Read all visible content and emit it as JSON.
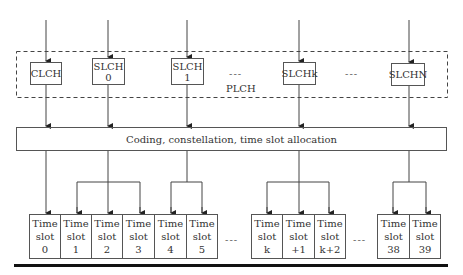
{
  "diagram": {
    "group_label": "PLCH",
    "channels": [
      {
        "line1": "CLCH",
        "line2": ""
      },
      {
        "line1": "SLCH",
        "line2": "0"
      },
      {
        "line1": "SLCH",
        "line2": "1"
      },
      {
        "line1": "SLCHk",
        "line2": ""
      },
      {
        "line1": "SLCHN",
        "line2": ""
      }
    ],
    "channel_ellipsis": "---",
    "process_block": "Coding, constellation, time slot allocation",
    "time_slots": [
      {
        "line1": "Time",
        "line2": "slot",
        "line3": "0"
      },
      {
        "line1": "Time",
        "line2": "slot",
        "line3": "1"
      },
      {
        "line1": "Time",
        "line2": "slot",
        "line3": "2"
      },
      {
        "line1": "Time",
        "line2": "slot",
        "line3": "3"
      },
      {
        "line1": "Time",
        "line2": "slot",
        "line3": "4"
      },
      {
        "line1": "Time",
        "line2": "slot",
        "line3": "5"
      },
      {
        "line1": "Time",
        "line2": "slot",
        "line3": "k"
      },
      {
        "line1": "Time",
        "line2": "slot",
        "line3": "+1"
      },
      {
        "line1": "Time",
        "line2": "slot",
        "line3": "k+2"
      },
      {
        "line1": "Time",
        "line2": "slot",
        "line3": "38"
      },
      {
        "line1": "Time",
        "line2": "slot",
        "line3": "39"
      }
    ],
    "slot_ellipsis": "---",
    "mapping": [
      {
        "channel": "CLCH",
        "slots": [
          "0"
        ]
      },
      {
        "channel": "SLCH 0",
        "slots": [
          "1",
          "2",
          "3"
        ]
      },
      {
        "channel": "SLCH 1",
        "slots": [
          "4",
          "5"
        ]
      },
      {
        "channel": "SLCHk",
        "slots": [
          "k",
          "+1",
          "k+2"
        ]
      },
      {
        "channel": "SLCHN",
        "slots": [
          "38",
          "39"
        ]
      }
    ]
  }
}
